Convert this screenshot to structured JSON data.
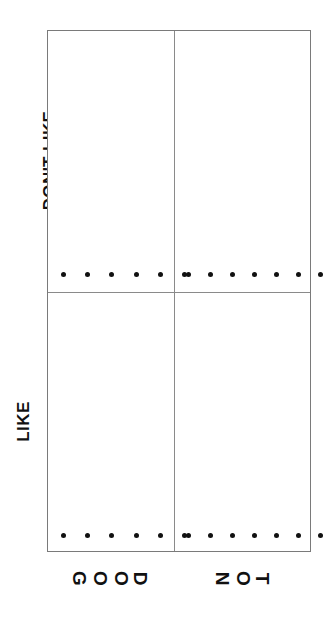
{
  "chart_data": {
    "type": "scatter",
    "title": "",
    "xlabel": "",
    "ylabel": "",
    "grid": false,
    "legend": null,
    "layout": "2x2 trellis / lattice panel grid",
    "row_labels": [
      "DON'T LIKE",
      "LIKE"
    ],
    "column_labels": [
      "GOOD",
      "NOT"
    ],
    "panels": [
      {
        "row": "DON'T LIKE",
        "column": "GOOD",
        "position": "top-left",
        "n_points": 6,
        "values": [
          0,
          0,
          0,
          0,
          0,
          0
        ],
        "note": "all points rest on the panel baseline"
      },
      {
        "row": "DON'T LIKE",
        "column": "NOT",
        "position": "top-right",
        "n_points": 7,
        "values": [
          0,
          0,
          0,
          0,
          0,
          0,
          0
        ],
        "note": "all points rest on the panel baseline"
      },
      {
        "row": "LIKE",
        "column": "GOOD",
        "position": "bottom-left",
        "n_points": 6,
        "values": [
          0,
          0,
          0,
          0,
          0,
          0
        ],
        "note": "all points rest on the panel baseline"
      },
      {
        "row": "LIKE",
        "column": "NOT",
        "position": "bottom-right",
        "n_points": 7,
        "values": [
          0,
          0,
          0,
          0,
          0,
          0,
          0
        ],
        "note": "all points rest on the panel baseline"
      }
    ],
    "colors": {
      "point": "#111111",
      "frame": "#7a7a7a",
      "divider": "#8a8a8a",
      "background": "#ffffff",
      "text": "#111111"
    }
  },
  "axis": {
    "y": {
      "top_label": "DON'T LIKE",
      "bottom_label": "LIKE"
    },
    "x": {
      "left_label": "GOOD",
      "left_letters": [
        "G",
        "O",
        "O",
        "D"
      ],
      "right_label": "NOT",
      "right_letters": [
        "N",
        "O",
        "T"
      ]
    }
  }
}
